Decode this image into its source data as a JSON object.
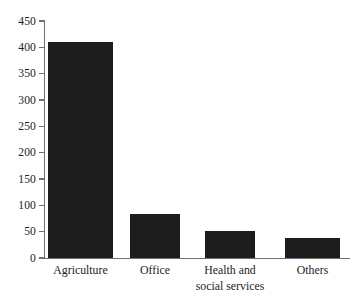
{
  "chart_data": {
    "type": "bar",
    "title": "",
    "subtitle": "",
    "xlabel": "",
    "ylabel": "",
    "categories": [
      "Agriculture",
      "Office",
      "Health and\nsocial services",
      "Others"
    ],
    "values": [
      411,
      83,
      52,
      38
    ],
    "ylim": [
      0,
      450
    ],
    "yticks": [
      0,
      50,
      100,
      150,
      200,
      250,
      300,
      350,
      400,
      450
    ],
    "ytick_labels": [
      "0",
      "50",
      "100",
      "150",
      "200",
      "250",
      "300",
      "350",
      "400",
      "450"
    ],
    "grid": false,
    "legend": null,
    "bar_color": "#1d1d1d",
    "axis_color": "#6f6f6f",
    "background": "#ffffff",
    "annotations": []
  }
}
